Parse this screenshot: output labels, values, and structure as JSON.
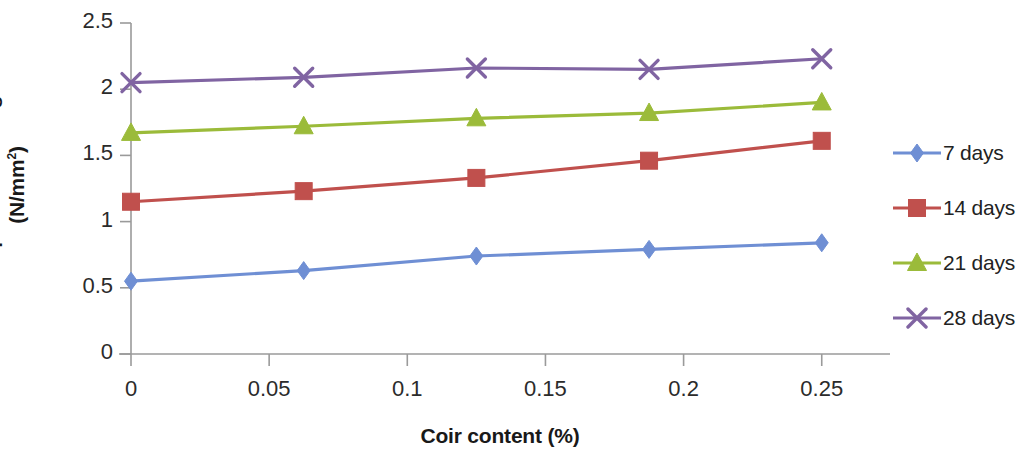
{
  "chart_data": {
    "type": "line",
    "title": "",
    "xlabel": "Coir content (%)",
    "ylabel": "Compressive strength (N/mm2)",
    "ylabel_main": "Compressive strength",
    "ylabel_unit_prefix": "(N/mm",
    "ylabel_unit_sup": "2",
    "ylabel_unit_suffix": ")",
    "x": [
      0,
      0.0625,
      0.125,
      0.1875,
      0.25
    ],
    "xlim": [
      0,
      0.27
    ],
    "ylim": [
      0,
      2.5
    ],
    "xticks": [
      0,
      0.05,
      0.1,
      0.15,
      0.2,
      0.25
    ],
    "xtick_labels": [
      "0",
      "0.05",
      "0.1",
      "0.15",
      "0.2",
      "0.25"
    ],
    "yticks": [
      0,
      0.5,
      1,
      1.5,
      2,
      2.5
    ],
    "ytick_labels": [
      "0",
      "0.5",
      "1",
      "1.5",
      "2",
      "2.5"
    ],
    "grid": false,
    "legend_position": "right",
    "series": [
      {
        "name": "7 days",
        "color": "#6f8fd4",
        "marker": "diamond",
        "values": [
          0.55,
          0.63,
          0.74,
          0.79,
          0.84
        ]
      },
      {
        "name": "14 days",
        "color": "#c0504d",
        "marker": "square",
        "values": [
          1.15,
          1.23,
          1.33,
          1.46,
          1.61
        ]
      },
      {
        "name": "21 days",
        "color": "#9bbb3a",
        "marker": "triangle",
        "values": [
          1.67,
          1.72,
          1.78,
          1.82,
          1.9
        ]
      },
      {
        "name": "28 days",
        "color": "#8064a2",
        "marker": "cross",
        "values": [
          2.05,
          2.09,
          2.16,
          2.15,
          2.23
        ]
      }
    ]
  },
  "legend": {
    "items": [
      {
        "label": "7 days"
      },
      {
        "label": "14 days"
      },
      {
        "label": "21 days"
      },
      {
        "label": "28 days"
      }
    ]
  },
  "axes": {
    "axis_color": "#9a9a9a"
  }
}
